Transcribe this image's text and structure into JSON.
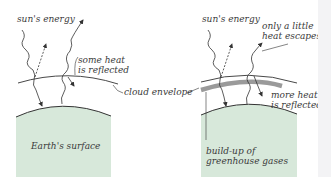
{
  "diagram": {
    "colors": {
      "earth_fill": "#d7e8da",
      "line": "#333333",
      "ghg_band": "#9a9a9a",
      "text": "#3a3a3a"
    },
    "left_panel": {
      "labels": {
        "sun": "sun's energy",
        "reflected_line1": "some heat",
        "reflected_line2": "is reflected",
        "surface": "Earth's surface"
      }
    },
    "shared": {
      "cloud_label": "cloud envelope"
    },
    "right_panel": {
      "labels": {
        "sun": "sun's energy",
        "escapes_line1": "only a little",
        "escapes_line2": "heat escapes",
        "reflected_line1": "more heat",
        "reflected_line2": "is reflected",
        "ghg_line1": "build-up of",
        "ghg_line2": "greenhouse gases"
      }
    }
  }
}
